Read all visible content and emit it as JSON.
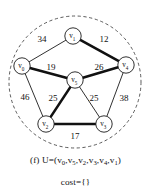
{
  "figure": {
    "label": "(f)",
    "caption_set": "U=(v0,v5,v2,v3,v4,v1)",
    "caption_cost": "cost={}",
    "background_color": "#ffffff",
    "ink_color": "#111111",
    "boundary_color": "#4a4a4a"
  },
  "graph": {
    "type": "weighted-undirected-graph",
    "boundary_shape": "dashed-ellipse",
    "nodes": [
      {
        "id": "v0",
        "label": "v",
        "sub": "0",
        "x": 22,
        "y": 66
      },
      {
        "id": "v1",
        "label": "v",
        "sub": "1",
        "x": 73,
        "y": 36
      },
      {
        "id": "v2",
        "label": "v",
        "sub": "2",
        "x": 46,
        "y": 124
      },
      {
        "id": "v3",
        "label": "v",
        "sub": "3",
        "x": 104,
        "y": 124
      },
      {
        "id": "v4",
        "label": "v",
        "sub": "4",
        "x": 126,
        "y": 65
      },
      {
        "id": "v5",
        "label": "v",
        "sub": "5",
        "x": 75,
        "y": 80
      }
    ],
    "edges": [
      {
        "from": "v0",
        "to": "v1",
        "weight": 34,
        "bold": false,
        "label_x": 42,
        "label_y": 40
      },
      {
        "from": "v1",
        "to": "v4",
        "weight": 12,
        "bold": true,
        "label_x": 104,
        "label_y": 40
      },
      {
        "from": "v0",
        "to": "v5",
        "weight": 19,
        "bold": true,
        "label_x": 51,
        "label_y": 68
      },
      {
        "from": "v5",
        "to": "v4",
        "weight": 26,
        "bold": true,
        "label_x": 99,
        "label_y": 68
      },
      {
        "from": "v0",
        "to": "v2",
        "weight": 46,
        "bold": false,
        "label_x": 25,
        "label_y": 98
      },
      {
        "from": "v5",
        "to": "v2",
        "weight": 25,
        "bold": true,
        "label_x": 53,
        "label_y": 99
      },
      {
        "from": "v5",
        "to": "v3",
        "weight": 25,
        "bold": false,
        "label_x": 94,
        "label_y": 99
      },
      {
        "from": "v4",
        "to": "v3",
        "weight": 38,
        "bold": false,
        "label_x": 124,
        "label_y": 99
      },
      {
        "from": "v2",
        "to": "v3",
        "weight": 17,
        "bold": true,
        "label_x": 75,
        "label_y": 137
      }
    ],
    "boundary": {
      "cx": 75,
      "cy": 82,
      "rx": 66,
      "ry": 66
    },
    "node_radius": 8.2
  }
}
